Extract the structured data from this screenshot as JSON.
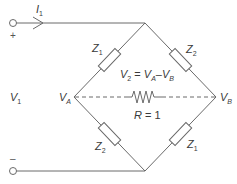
{
  "diagram": {
    "type": "bridge-circuit",
    "colors": {
      "line": "#6a6a6a",
      "text": "#3a3a3a",
      "background": "#ffffff"
    },
    "current_label": {
      "symbol": "I",
      "sub": "1"
    },
    "terminals": {
      "plus": "+",
      "minus": "–"
    },
    "input_voltage": {
      "symbol": "V",
      "sub": "1"
    },
    "nodes": {
      "left": {
        "symbol": "V",
        "sub": "A"
      },
      "right": {
        "symbol": "V",
        "sub": "B"
      }
    },
    "impedances": {
      "top_left": {
        "symbol": "Z",
        "sub": "1"
      },
      "top_right": {
        "symbol": "Z",
        "sub": "2"
      },
      "bottom_left": {
        "symbol": "Z",
        "sub": "2"
      },
      "bottom_right": {
        "symbol": "Z",
        "sub": "1"
      }
    },
    "output_equation": {
      "lhs": "V",
      "lhs_sub": "2",
      "eq": " = ",
      "a": "V",
      "a_sub": "A",
      "minus": "–",
      "b": "V",
      "b_sub": "B"
    },
    "load": {
      "symbol": "R",
      "value": " = 1"
    }
  }
}
